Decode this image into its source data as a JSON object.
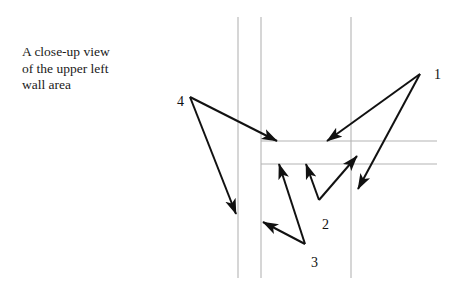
{
  "figure": {
    "type": "annotated-line-diagram",
    "background_color": "#ffffff",
    "caption": {
      "text": "A close-up view\nof the upper left\nwall area",
      "lines": [
        "A close-up view",
        "of the upper left",
        "wall area"
      ],
      "x": 22,
      "y": 44,
      "color": "#1a1a1a",
      "font_size": 13.5
    },
    "wall_lines": {
      "color": "#b4b4b4",
      "stroke_width": 1.1,
      "vertical": [
        {
          "name": "wall-line-left-outer",
          "x": 238,
          "y1": 17,
          "y2": 278
        },
        {
          "name": "wall-line-left-inner",
          "x": 261,
          "y1": 17,
          "y2": 278
        },
        {
          "name": "wall-line-right",
          "x": 351,
          "y1": 17,
          "y2": 278
        }
      ],
      "horizontal": [
        {
          "name": "wall-line-upper",
          "y": 141,
          "x1": 261,
          "x2": 437
        },
        {
          "name": "wall-line-lower",
          "y": 164,
          "x1": 261,
          "x2": 437
        }
      ]
    },
    "annotation_color": "#111111",
    "annotation_stroke_width": 2.0,
    "callouts": [
      {
        "id": "1",
        "label": "1",
        "label_x": 434,
        "label_y": 68,
        "origin": {
          "x": 420,
          "y": 74
        },
        "arrows": [
          {
            "name": "callout-1-arrow-a",
            "x1": 420,
            "y1": 74,
            "x2": 327,
            "y2": 141
          },
          {
            "name": "callout-1-arrow-b",
            "x1": 420,
            "y1": 74,
            "x2": 358,
            "y2": 189
          }
        ]
      },
      {
        "id": "2",
        "label": "2",
        "label_x": 322,
        "label_y": 218,
        "origin": {
          "x": 319,
          "y": 200
        },
        "arrows": [
          {
            "name": "callout-2-arrow-a",
            "x1": 319,
            "y1": 200,
            "x2": 306,
            "y2": 164
          },
          {
            "name": "callout-2-arrow-b",
            "x1": 319,
            "y1": 200,
            "x2": 357,
            "y2": 156
          }
        ]
      },
      {
        "id": "3",
        "label": "3",
        "label_x": 311,
        "label_y": 256,
        "origin": {
          "x": 305,
          "y": 244
        },
        "arrows": [
          {
            "name": "callout-3-arrow-a",
            "x1": 305,
            "y1": 244,
            "x2": 263,
            "y2": 222
          },
          {
            "name": "callout-3-arrow-b",
            "x1": 305,
            "y1": 244,
            "x2": 279,
            "y2": 164
          }
        ]
      },
      {
        "id": "4",
        "label": "4",
        "label_x": 177,
        "label_y": 95,
        "origin": {
          "x": 190,
          "y": 97
        },
        "arrows": [
          {
            "name": "callout-4-arrow-a",
            "x1": 190,
            "y1": 97,
            "x2": 277,
            "y2": 141
          },
          {
            "name": "callout-4-arrow-b",
            "x1": 190,
            "y1": 97,
            "x2": 236,
            "y2": 214
          }
        ]
      }
    ]
  }
}
